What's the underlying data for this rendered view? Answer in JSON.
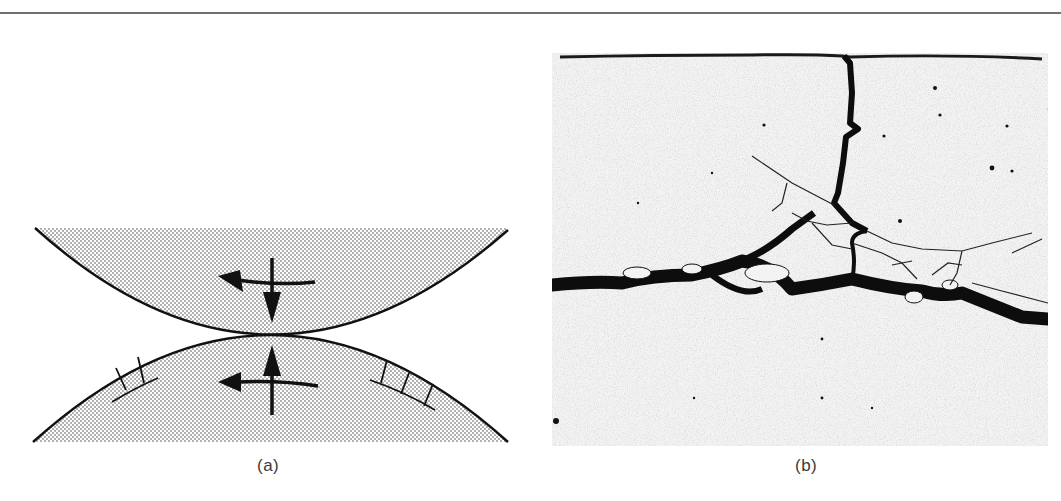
{
  "figure": {
    "panels": [
      {
        "id": "a",
        "label": "(a)",
        "type": "schematic",
        "description": "Two curved bodies in rolling contact with normal and tangential force arrows and surface crack marks",
        "fill_pattern": "stipple",
        "elements": {
          "upper_body": {
            "normal_arrow": "down",
            "tangential_arrow": "left"
          },
          "lower_body": {
            "normal_arrow": "up",
            "tangential_arrow": "left",
            "surface_cracks": [
              "left",
              "right"
            ]
          }
        }
      },
      {
        "id": "b",
        "label": "(b)",
        "type": "micrograph",
        "description": "Cross-section micrograph showing a vertical crack from the surface branching into a horizontal subsurface crack network"
      }
    ],
    "colors": {
      "line": "#111111",
      "stipple": "#9a9a9a",
      "background": "#ffffff",
      "rule": "#6f6f6f",
      "micrograph_bg": "#f2f2f2",
      "crack": "#0d0d0d"
    }
  }
}
